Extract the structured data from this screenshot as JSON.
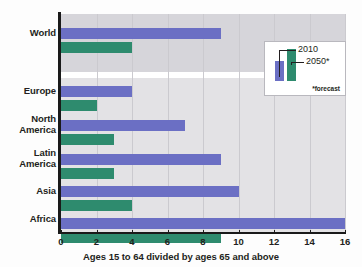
{
  "chart_data": {
    "type": "bar",
    "orientation": "horizontal",
    "title": "",
    "subtitle": "",
    "xlabel": "Ages 15 to 64 divided by ages 65 and above",
    "ylabel": "",
    "categories": [
      "World",
      "Europe",
      "North America",
      "Latin America",
      "Asia",
      "Africa"
    ],
    "series": [
      {
        "name": "2010",
        "color": "#6b6fc4",
        "values": [
          9,
          4,
          7,
          9,
          10,
          16
        ]
      },
      {
        "name": "2050*",
        "color": "#2e8b6e",
        "values": [
          4,
          2,
          3,
          3,
          4,
          9
        ]
      }
    ],
    "xlim": [
      0,
      16
    ],
    "xticks": [
      0,
      2,
      4,
      6,
      8,
      10,
      12,
      14,
      16
    ],
    "xtick_labels": [
      "0",
      "2",
      "4",
      "6",
      "8",
      "10",
      "12",
      "14",
      "16"
    ],
    "grid": "vertical",
    "legend_position": "upper-right-inset",
    "annotations": [
      "*forecast"
    ]
  },
  "legend": {
    "label_2010": "2010",
    "label_2050": "2050*",
    "footnote": "*forecast"
  },
  "axis": {
    "x_title": "Ages 15 to 64 divided by ages 65 and above"
  },
  "colors": {
    "bar_2010": "#6b6fc4",
    "bar_2050": "#2e8b6e",
    "plot_background": "#e3e2e5",
    "world_band_background": "#d6d5da",
    "axis": "#1a1a1a",
    "text": "#231f20"
  }
}
